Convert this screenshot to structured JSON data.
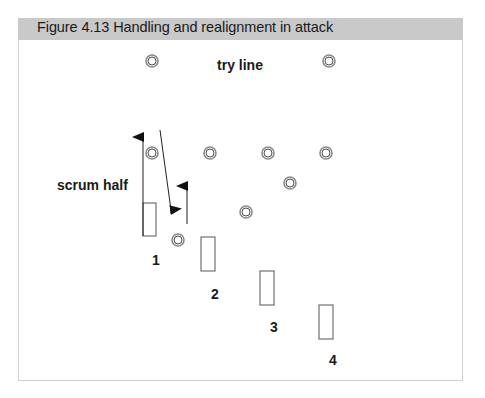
{
  "figure": {
    "title": "Figure 4.13  Handling and realignment in attack",
    "header_color": "#c9c9c9"
  },
  "labels": {
    "try_line": "try line",
    "scrum_half": "scrum half",
    "player_numbers": [
      "1",
      "2",
      "3",
      "4"
    ]
  },
  "defenders": [
    {
      "x": 152,
      "y": 61
    },
    {
      "x": 329,
      "y": 61
    },
    {
      "x": 152,
      "y": 153
    },
    {
      "x": 210,
      "y": 153
    },
    {
      "x": 268,
      "y": 153
    },
    {
      "x": 326,
      "y": 153
    },
    {
      "x": 290,
      "y": 183
    },
    {
      "x": 246,
      "y": 212
    },
    {
      "x": 178,
      "y": 240
    }
  ],
  "attackers": [
    {
      "label": "1",
      "x": 143,
      "y": 203,
      "w": 13,
      "h": 33,
      "label_x": 156,
      "label_y": 265
    },
    {
      "label": "2",
      "x": 201,
      "y": 237,
      "w": 14,
      "h": 34,
      "label_x": 215,
      "label_y": 299
    },
    {
      "label": "3",
      "x": 260,
      "y": 271,
      "w": 14,
      "h": 34,
      "label_x": 274,
      "label_y": 332
    },
    {
      "label": "4",
      "x": 319,
      "y": 305,
      "w": 14,
      "h": 34,
      "label_x": 333,
      "label_y": 365
    }
  ],
  "arrows": [
    {
      "name": "scrum-half-forward-arrow",
      "x1": 143,
      "y1": 236,
      "x2": 143,
      "y2": 137
    },
    {
      "name": "diagonal-run-arrow",
      "x1": 160,
      "y1": 130,
      "x2": 171,
      "y2": 210
    },
    {
      "name": "player-support-arrow",
      "x1": 187,
      "y1": 224,
      "x2": 187,
      "y2": 186
    }
  ]
}
